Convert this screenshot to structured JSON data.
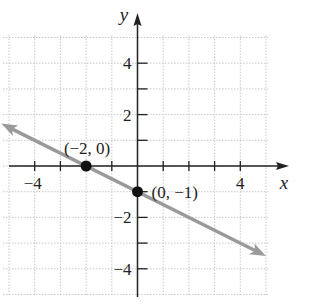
{
  "chart_data": {
    "type": "line",
    "title": "",
    "xlabel": "x",
    "ylabel": "y",
    "xlim": [
      -5,
      5
    ],
    "ylim": [
      -5,
      5
    ],
    "grid": true,
    "x_ticks": [
      -4,
      4
    ],
    "y_ticks": [
      4,
      2,
      -2,
      -4
    ],
    "x_tick_labels": [
      "−4",
      "4"
    ],
    "y_tick_labels": [
      "4",
      "2",
      "−2",
      "−4"
    ],
    "series": [
      {
        "name": "line",
        "equation": "y = -x/2 - 1",
        "slope": -0.5,
        "intercept": -1,
        "x": [
          -5,
          5
        ],
        "y": [
          1.5,
          -3.5
        ],
        "color": "#9a9a9a",
        "arrows": true
      }
    ],
    "points": [
      {
        "x": -2,
        "y": 0,
        "label": "(−2, 0)"
      },
      {
        "x": 0,
        "y": -1,
        "label": "(0, −1)"
      }
    ]
  }
}
